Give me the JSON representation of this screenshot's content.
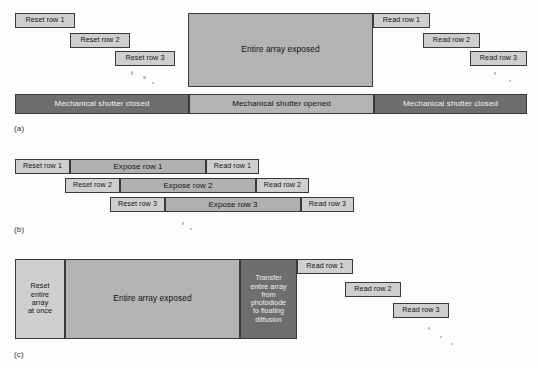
{
  "figure": {
    "type": "timing-diagram",
    "panels": [
      {
        "id": "a",
        "label": "(a)",
        "caption_label": "(a)",
        "blocks": [
          {
            "name": "reset-row-1",
            "text": "Reset row 1"
          },
          {
            "name": "reset-row-2",
            "text": "Reset row 2"
          },
          {
            "name": "reset-row-3",
            "text": "Reset row 3"
          },
          {
            "name": "entire-array-exposed",
            "text": "Entire array exposed"
          },
          {
            "name": "read-row-1",
            "text": "Read row 1"
          },
          {
            "name": "read-row-2",
            "text": "Read row 2"
          },
          {
            "name": "read-row-3",
            "text": "Read row 3"
          }
        ],
        "shutter_bar": [
          {
            "name": "shutter-closed-left",
            "text": "Mechanical shutter closed",
            "state": "closed"
          },
          {
            "name": "shutter-opened",
            "text": "Mechanical shutter opened",
            "state": "opened"
          },
          {
            "name": "shutter-closed-right",
            "text": "Mechanical shutter closed",
            "state": "closed"
          }
        ]
      },
      {
        "id": "b",
        "label": "(b)",
        "caption_label": "(b)",
        "rows": [
          {
            "name": "row-1",
            "reset": "Reset row 1",
            "expose": "Expose row 1",
            "read": "Read row 1"
          },
          {
            "name": "row-2",
            "reset": "Reset row 2",
            "expose": "Expose row 2",
            "read": "Read row 2"
          },
          {
            "name": "row-3",
            "reset": "Reset row 3",
            "expose": "Expose row 3",
            "read": "Read row 3"
          }
        ]
      },
      {
        "id": "c",
        "label": "(c)",
        "caption_label": "(c)",
        "blocks": [
          {
            "name": "reset-entire-array",
            "text": "Reset\nentire\narray\nat once"
          },
          {
            "name": "entire-array-exposed",
            "text": "Entire array exposed"
          },
          {
            "name": "transfer-entire-array",
            "text": "Transfer\nentire array\nfrom\nphotodiode\nto floating\ndiffusion"
          },
          {
            "name": "read-row-1",
            "text": "Read row 1"
          },
          {
            "name": "read-row-2",
            "text": "Read row 2"
          },
          {
            "name": "read-row-3",
            "text": "Read row 3"
          }
        ]
      }
    ]
  },
  "colors": {
    "light_gray": "#cfcfcf",
    "mid_gray": "#b3b3b3",
    "expose_gray": "#b0b0b0",
    "dark_gray": "#6e6e6e",
    "border": "#3a3a3a",
    "background": "#fdfdfc"
  }
}
